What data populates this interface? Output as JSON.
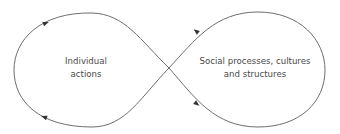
{
  "diagram": {
    "type": "figure-eight feedback loop",
    "stroke_color": "#6e6e6e",
    "text_color": "#4a4a4a",
    "left_node": {
      "lines": [
        "Individual",
        "actions"
      ]
    },
    "right_node": {
      "lines": [
        "Social processes, cultures",
        "and structures"
      ]
    },
    "arrows": [
      {
        "position": "left-top",
        "direction": "right"
      },
      {
        "position": "left-bottom",
        "direction": "left"
      },
      {
        "position": "right-top",
        "direction": "left"
      },
      {
        "position": "right-bottom",
        "direction": "right"
      }
    ]
  }
}
